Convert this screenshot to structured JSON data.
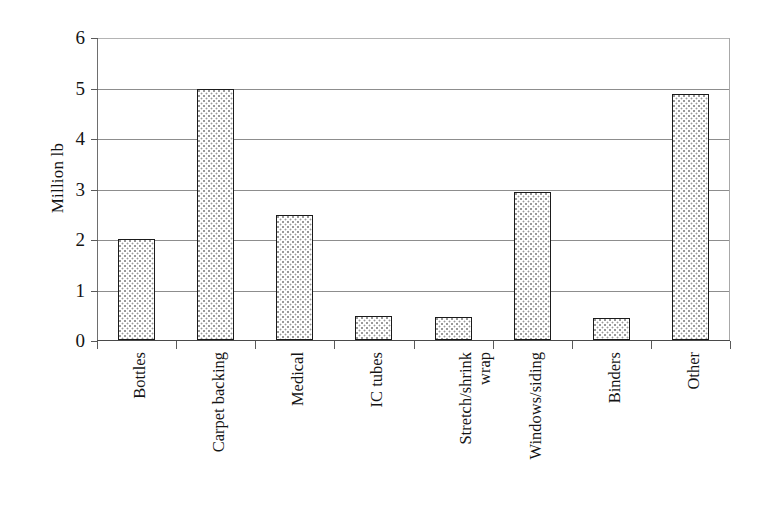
{
  "chart_data": {
    "type": "bar",
    "title": "",
    "subtitle": "",
    "xlabel": "",
    "ylabel": "Million lb",
    "ylim": [
      0,
      6
    ],
    "ytick_labels": [
      "0",
      "1",
      "2",
      "3",
      "4",
      "5",
      "6"
    ],
    "ytick_values": [
      0,
      1,
      2,
      3,
      4,
      5,
      6
    ],
    "grid": true,
    "grid_axis": "y",
    "legend": false,
    "legend_position": "none",
    "categories": [
      "Bottles",
      "Carpet backing",
      "Medical",
      "IC tubes",
      "Stretch/shrink\nwrap",
      "Windows/siding",
      "Binders",
      "Other"
    ],
    "values": [
      2.0,
      4.97,
      2.47,
      0.48,
      0.46,
      2.94,
      0.44,
      4.88
    ],
    "bar_style": {
      "fill": "#ffffff",
      "pattern": "fine-dotted-stipple",
      "pattern_color": "#9a9a9a",
      "border_color": "#1b1b1b"
    },
    "axis_color": "#4a4a4a",
    "gridline_color": "#8d8d8d",
    "text_color": "#141414",
    "background": "#ffffff"
  },
  "axis": {
    "y_title": "Million lb",
    "ticks": [
      {
        "label": "6",
        "value": 6
      },
      {
        "label": "5",
        "value": 5
      },
      {
        "label": "4",
        "value": 4
      },
      {
        "label": "3",
        "value": 3
      },
      {
        "label": "2",
        "value": 2
      },
      {
        "label": "1",
        "value": 1
      },
      {
        "label": "0",
        "value": 0
      }
    ]
  }
}
